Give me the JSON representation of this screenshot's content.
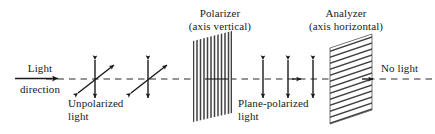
{
  "figure": {
    "background_color": "#ffffff",
    "line_color": "#1a1a1a",
    "text_color": "#1a1a1a"
  },
  "labels": {
    "light_direction_line1": "Light",
    "light_direction_line2": "direction",
    "unpolarized_line1": "Unpolarized",
    "unpolarized_line2": "light",
    "polarizer_line1": "Polarizer",
    "polarizer_line2": "(axis vertical)",
    "plane_polarized_line1": "Plane-polarized",
    "plane_polarized_line2": "light",
    "analyzer_line1": "Analyzer",
    "analyzer_line2": "(axis horizontal)",
    "no_light": "No light"
  },
  "diagram_elements": {
    "optical_axis": {
      "name": "dashed-optical-axis",
      "style": "dashed",
      "y": 79,
      "x_start": 46,
      "x_end": 435
    },
    "incoming_arrow": {
      "name": "light-direction-arrow",
      "style": "solid-arrow-right",
      "x_start": 15,
      "x_end": 62,
      "y": 79
    },
    "unpolarized_markers": {
      "count": 2,
      "x_positions": [
        95,
        148
      ],
      "description": "crossed vertical and diagonal double-headed arrows"
    },
    "polarizer": {
      "name": "polarizer-plate",
      "axis": "vertical",
      "hatch_direction": "vertical",
      "line_count": 12,
      "x_left": 193,
      "x_right": 232,
      "slant": "up-right"
    },
    "plane_polarized_markers": {
      "count": 3,
      "x_positions": [
        263,
        288,
        313
      ],
      "description": "vertical double-headed arrows"
    },
    "propagation_arrowhead": {
      "name": "axis-arrowhead-mid",
      "x": 300,
      "y": 79
    },
    "analyzer": {
      "name": "analyzer-plate",
      "axis": "horizontal",
      "hatch_direction": "diagonal",
      "line_count": 14,
      "x_left": 330,
      "x_right": 372,
      "slant": "up-right"
    },
    "exit_arrowhead": {
      "name": "axis-arrowhead-exit",
      "x": 372,
      "y": 79
    }
  }
}
